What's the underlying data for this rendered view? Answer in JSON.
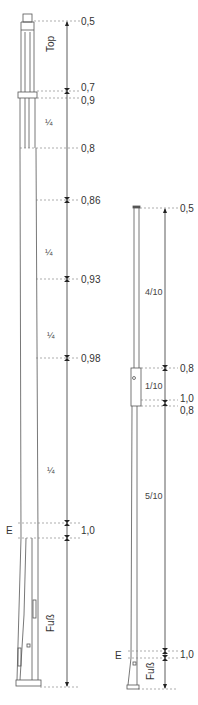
{
  "diagram": {
    "left_pole": {
      "labels": {
        "top": "Top",
        "foot": "Fuß",
        "e": "E"
      },
      "dimensions": [
        {
          "value": "0,5",
          "y": 21
        },
        {
          "value": "0,7",
          "y": 91
        },
        {
          "value": "0,9",
          "y": 102
        },
        {
          "value": "0,8",
          "y": 148
        },
        {
          "value": "0,86",
          "y": 200
        },
        {
          "value": "0,93",
          "y": 279
        },
        {
          "value": "0,98",
          "y": 358
        },
        {
          "value": "1,0",
          "y": 530
        }
      ],
      "segments": [
        {
          "label": "¼",
          "y": 122
        },
        {
          "label": "¼",
          "y": 252
        },
        {
          "label": "¼",
          "y": 336
        },
        {
          "label": "¼",
          "y": 470
        }
      ]
    },
    "right_pole": {
      "labels": {
        "foot": "Fuß",
        "e": "E"
      },
      "dimensions": [
        {
          "value": "0,5",
          "y": 208
        },
        {
          "value": "0,8",
          "y": 368
        },
        {
          "value": "1,0",
          "y": 400
        },
        {
          "value": "0,8",
          "y": 412
        },
        {
          "value": "1,0",
          "y": 654
        }
      ],
      "segments": [
        {
          "label": "4/10",
          "y": 292
        },
        {
          "label": "1/10",
          "y": 386
        },
        {
          "label": "5/10",
          "y": 496
        }
      ]
    }
  }
}
